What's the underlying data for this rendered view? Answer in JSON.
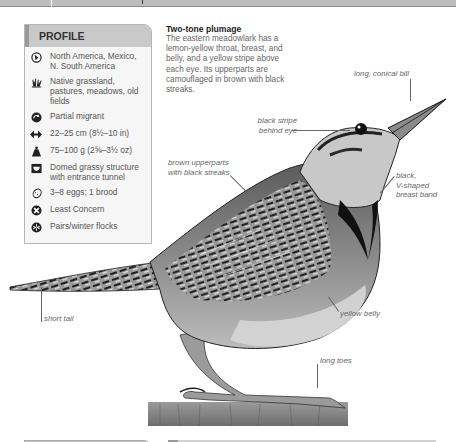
{
  "profile": {
    "title": "PROFILE",
    "items": [
      {
        "icon": "range-globe-icon",
        "text": "North America, Mexico, N. South America"
      },
      {
        "icon": "habitat-grass-icon",
        "text": "Native grassland, pastures, meadows, old fields"
      },
      {
        "icon": "migration-icon",
        "text": "Partial migrant"
      },
      {
        "icon": "length-arrows-icon",
        "text": "22–25 cm (8½–10 in)"
      },
      {
        "icon": "weight-icon",
        "text": "75–100 g (2⅝–3½ oz)"
      },
      {
        "icon": "nest-icon",
        "text": "Domed grassy structure with entrance tunnel"
      },
      {
        "icon": "egg-icon",
        "text": "3–8 eggs; 1 brood"
      },
      {
        "icon": "conservation-status-icon",
        "text": "Least Concern"
      },
      {
        "icon": "social-flock-icon",
        "text": "Pairs/winter flocks"
      }
    ]
  },
  "description": {
    "title": "Two-tone plumage",
    "body": "The eastern meadowlark has a lemon-yellow throat, breast, and belly, and a yellow stripe above each eye. Its upperparts are camouflaged in brown with black streaks."
  },
  "annotations": {
    "bill": "long, conical bill",
    "eye_stripe_1": "black stripe",
    "eye_stripe_2": "behind eye",
    "upperparts_1": "brown upperparts",
    "upperparts_2": "with black streaks",
    "breast_band_1": "black,",
    "breast_band_2": "V-shaped",
    "breast_band_3": "breast band",
    "tail": "short tail",
    "belly": "yellow belly",
    "toes": "long toes"
  },
  "colors": {
    "header_bg": "#c9c9c9",
    "panel_bg": "#f6f6f6",
    "text": "#555555"
  }
}
